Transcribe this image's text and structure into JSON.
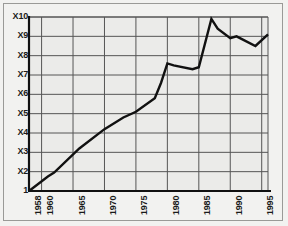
{
  "chart_data": {
    "type": "line",
    "title": "",
    "subtitle": "",
    "xlabel": "",
    "ylabel": "",
    "grid": true,
    "legend": "none",
    "xlim": [
      1958,
      1996
    ],
    "ylim": [
      1,
      10
    ],
    "y_tick_labels": [
      "X10",
      "X9",
      "X8",
      "X7",
      "X6",
      "X5",
      "X4",
      "X3",
      "X2",
      "1"
    ],
    "y_tick_values": [
      10,
      9,
      8,
      7,
      6,
      5,
      4,
      3,
      2,
      1
    ],
    "x_tick_labels": [
      "1958",
      "1960",
      "1965",
      "1970",
      "1975",
      "1980",
      "1985",
      "1990",
      "1995"
    ],
    "x_tick_values": [
      1958,
      1960,
      1965,
      1970,
      1975,
      1980,
      1985,
      1990,
      1995
    ],
    "series": [
      {
        "name": "growth-multiple",
        "color": "#111111",
        "x": [
          1958,
          1961,
          1962,
          1966,
          1970,
          1973,
          1975,
          1978,
          1979,
          1980,
          1981,
          1984,
          1985,
          1987,
          1988,
          1990,
          1991,
          1994,
          1996
        ],
        "values": [
          1.0,
          1.75,
          1.95,
          3.2,
          4.2,
          4.8,
          5.1,
          5.8,
          6.6,
          7.6,
          7.5,
          7.3,
          7.4,
          9.9,
          9.4,
          8.9,
          9.0,
          8.5,
          9.1
        ]
      }
    ]
  },
  "figure": {
    "background_color": "#f2f2f0",
    "plot_background_color": "#ebebe9",
    "grid_color": "#555555",
    "axis_color": "#111111",
    "frame_color": "#9a9a97",
    "line_color": "#111111",
    "line_width": 2.4
  }
}
